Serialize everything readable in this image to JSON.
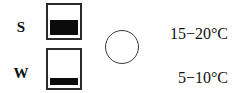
{
  "figure": {
    "type": "legend-key",
    "background_color": "#ffffff",
    "ink_color": "#111111"
  },
  "rows": [
    {
      "label": "S",
      "symbol": "filled-square-half",
      "fill_fraction": 0.45,
      "temperature": "15−20°C"
    },
    {
      "label": "W",
      "symbol": "filled-square-thin-bar",
      "fill_fraction": 0.18,
      "temperature": "5−10°C"
    }
  ],
  "circle": {
    "name": "empty-circle-symbol",
    "fill": "none",
    "stroke_color": "#3a3a3a"
  }
}
